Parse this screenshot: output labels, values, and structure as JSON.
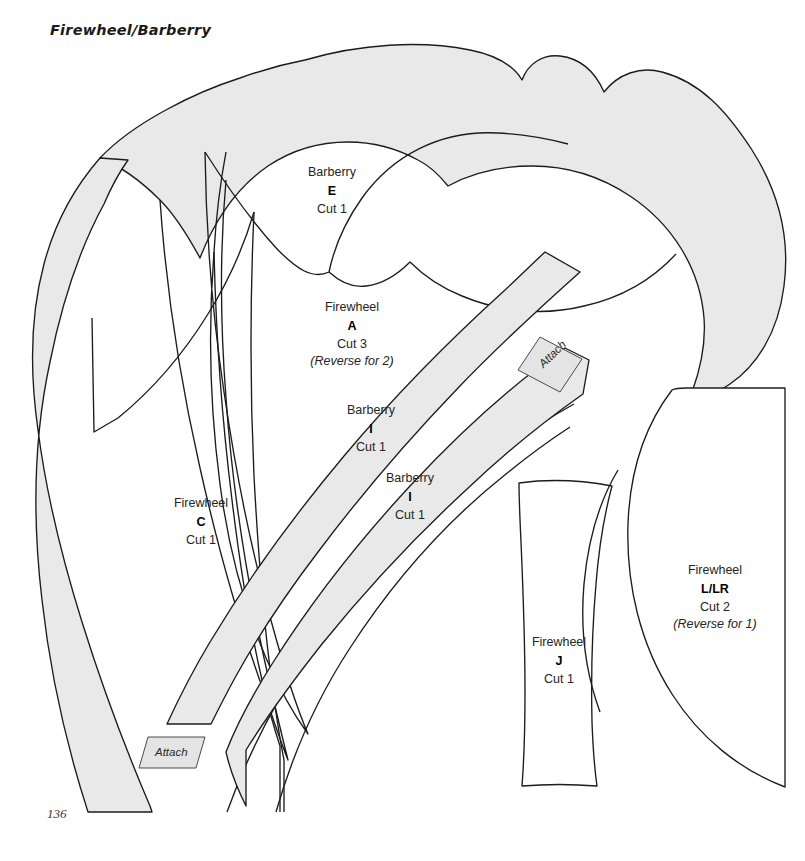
{
  "page": {
    "title": "Firewheel/Barberry",
    "number": "136",
    "background_color": "#ffffff",
    "piece_fill_color": "#e9e9e9",
    "outline_color": "#1c1c1c"
  },
  "pieces": [
    {
      "id": "E",
      "plant": "Barberry",
      "letter": "E",
      "cut": "Cut 1",
      "reverse": "",
      "filled": true,
      "label_x": 294,
      "label_y": 164
    },
    {
      "id": "A",
      "plant": "Firewheel",
      "letter": "A",
      "cut": "Cut 3",
      "reverse": "(Reverse for 2)",
      "filled": false,
      "label_x": 298,
      "label_y": 299
    },
    {
      "id": "I-upper",
      "plant": "Barberry",
      "letter": "I",
      "cut": "Cut 1",
      "reverse": "",
      "filled": true,
      "label_x": 333,
      "label_y": 402
    },
    {
      "id": "I-lower",
      "plant": "Barberry",
      "letter": "I",
      "cut": "Cut 1",
      "reverse": "",
      "filled": true,
      "label_x": 372,
      "label_y": 470
    },
    {
      "id": "C",
      "plant": "Firewheel",
      "letter": "C",
      "cut": "Cut 1",
      "reverse": "",
      "filled": false,
      "label_x": 163,
      "label_y": 495
    },
    {
      "id": "J",
      "plant": "Firewheel",
      "letter": "J",
      "cut": "Cut 1",
      "reverse": "",
      "filled": false,
      "label_x": 521,
      "label_y": 634
    },
    {
      "id": "L-LR",
      "plant": "Firewheel",
      "letter": "L/LR",
      "cut": "Cut 2",
      "reverse": "(Reverse for 1)",
      "filled": false,
      "label_x": 661,
      "label_y": 562
    }
  ],
  "attach_tabs": [
    {
      "id": "attach-upper",
      "text": "Attach",
      "x": 536,
      "y": 340
    },
    {
      "id": "attach-lower",
      "text": "Attach",
      "x": 152,
      "y": 750
    }
  ]
}
